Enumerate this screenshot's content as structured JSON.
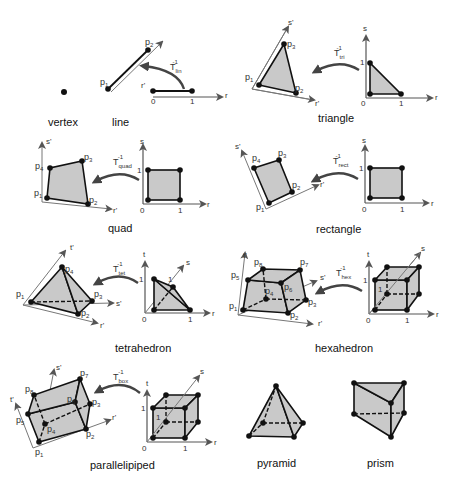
{
  "colors": {
    "face_fill": "#c9c9c9",
    "edge": "#111111",
    "axis": "#555555",
    "arrow": "#444444"
  },
  "labels": {
    "vertex": "vertex",
    "line": "line",
    "triangle": "triangle",
    "quad": "quad",
    "rectangle": "rectangle",
    "tetrahedron": "tetrahedron",
    "hexahedron": "hexahedron",
    "parallelipiped": "parallelipiped",
    "pyramid": "pyramid",
    "prism": "prism"
  },
  "axes": {
    "r": "r",
    "s": "s",
    "t": "t",
    "rp": "r'",
    "sp": "s'",
    "tp": "t'",
    "zero": "0",
    "one": "1"
  },
  "points": {
    "p": "p",
    "n1": "1",
    "n2": "2",
    "n3": "3",
    "n4": "4",
    "n5": "5",
    "n6": "6",
    "n7": "7",
    "n8": "8"
  },
  "transforms": {
    "T": "T",
    "inv": "-1",
    "lin": "lin",
    "tri": "tri",
    "quad": "quad",
    "rect": "rect",
    "tet": "tet",
    "hex": "hex",
    "box": "box"
  }
}
